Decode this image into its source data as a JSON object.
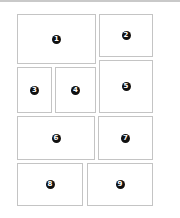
{
  "diagram": {
    "type": "panel-layout",
    "colors": {
      "border": "#c4c4c4",
      "badge": "#111111",
      "badge_text": "#ffffff",
      "background": "#ffffff",
      "top_rule": "#c9c9c9"
    },
    "panels": [
      {
        "id": 1,
        "label": "1",
        "x": 17,
        "y": 14,
        "w": 79,
        "h": 50
      },
      {
        "id": 2,
        "label": "2",
        "x": 99,
        "y": 14,
        "w": 54,
        "h": 43
      },
      {
        "id": 3,
        "label": "3",
        "x": 17,
        "y": 67,
        "w": 35,
        "h": 46
      },
      {
        "id": 4,
        "label": "4",
        "x": 55,
        "y": 67,
        "w": 41,
        "h": 46
      },
      {
        "id": 5,
        "label": "5",
        "x": 99,
        "y": 60,
        "w": 54,
        "h": 53
      },
      {
        "id": 6,
        "label": "6",
        "x": 17,
        "y": 116,
        "w": 78,
        "h": 44
      },
      {
        "id": 7,
        "label": "7",
        "x": 98,
        "y": 116,
        "w": 55,
        "h": 44
      },
      {
        "id": 8,
        "label": "8",
        "x": 17,
        "y": 163,
        "w": 66,
        "h": 43
      },
      {
        "id": 9,
        "label": "9",
        "x": 87,
        "y": 163,
        "w": 66,
        "h": 43
      }
    ]
  }
}
